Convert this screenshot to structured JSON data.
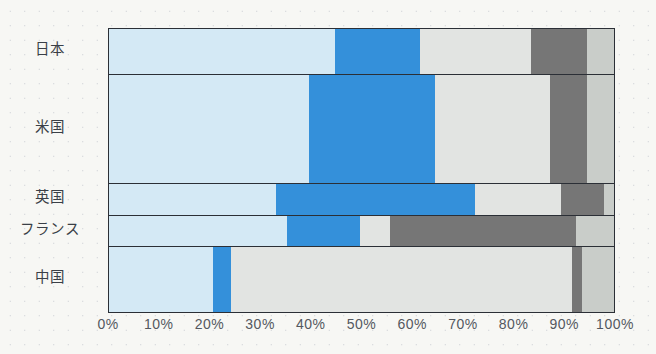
{
  "chart_data": {
    "type": "bar",
    "orientation": "horizontal",
    "stacked": true,
    "normalized": true,
    "title": "",
    "xlabel": "",
    "ylabel": "",
    "xlim": [
      0,
      100
    ],
    "grid": false,
    "legend": "none",
    "categories": [
      "日本",
      "米国",
      "英国",
      "フランス",
      "中国"
    ],
    "tick_labels": [
      "0%",
      "10%",
      "20%",
      "30%",
      "40%",
      "50%",
      "60%",
      "70%",
      "80%",
      "90%",
      "100%"
    ],
    "tick_values": [
      0,
      10,
      20,
      30,
      40,
      50,
      60,
      70,
      80,
      90,
      100
    ],
    "colors": {
      "series1": "#d4e9f5",
      "series2": "#3490da",
      "series3": "#e2e4e2",
      "series4": "#767676",
      "series5": "#c9cdc9"
    },
    "series": [
      {
        "name": "series1",
        "color": "#d4e9f5",
        "values": [
          44.8,
          39.6,
          33.1,
          35.3,
          20.5
        ]
      },
      {
        "name": "series2",
        "color": "#3490da",
        "values": [
          16.8,
          25.0,
          39.3,
          14.4,
          3.6
        ]
      },
      {
        "name": "series3",
        "color": "#e2e4e2",
        "values": [
          22.0,
          22.8,
          17.2,
          5.9,
          67.6
        ]
      },
      {
        "name": "series4",
        "color": "#767676",
        "values": [
          11.1,
          7.3,
          8.5,
          36.9,
          2.0
        ]
      },
      {
        "name": "series5",
        "color": "#c9cdc9",
        "values": [
          5.3,
          5.3,
          1.9,
          7.5,
          6.3
        ]
      }
    ],
    "row_heights_px": [
      46,
      110,
      32,
      32,
      65
    ],
    "rows": [
      {
        "category": "日本",
        "segments": [
          {
            "series": "series1",
            "value": 44.8,
            "color": "#d4e9f5"
          },
          {
            "series": "series2",
            "value": 16.8,
            "color": "#3490da"
          },
          {
            "series": "series3",
            "value": 22.0,
            "color": "#e2e4e2"
          },
          {
            "series": "series4",
            "value": 11.1,
            "color": "#767676"
          },
          {
            "series": "series5",
            "value": 5.3,
            "color": "#c9cdc9"
          }
        ]
      },
      {
        "category": "米国",
        "segments": [
          {
            "series": "series1",
            "value": 39.6,
            "color": "#d4e9f5"
          },
          {
            "series": "series2",
            "value": 25.0,
            "color": "#3490da"
          },
          {
            "series": "series3",
            "value": 22.8,
            "color": "#e2e4e2"
          },
          {
            "series": "series4",
            "value": 7.3,
            "color": "#767676"
          },
          {
            "series": "series5",
            "value": 5.3,
            "color": "#c9cdc9"
          }
        ]
      },
      {
        "category": "英国",
        "segments": [
          {
            "series": "series1",
            "value": 33.1,
            "color": "#d4e9f5"
          },
          {
            "series": "series2",
            "value": 39.3,
            "color": "#3490da"
          },
          {
            "series": "series3",
            "value": 17.2,
            "color": "#e2e4e2"
          },
          {
            "series": "series4",
            "value": 8.5,
            "color": "#767676"
          },
          {
            "series": "series5",
            "value": 1.9,
            "color": "#c9cdc9"
          }
        ]
      },
      {
        "category": "フランス",
        "segments": [
          {
            "series": "series1",
            "value": 35.3,
            "color": "#d4e9f5"
          },
          {
            "series": "series2",
            "value": 14.4,
            "color": "#3490da"
          },
          {
            "series": "series3",
            "value": 5.9,
            "color": "#e2e4e2"
          },
          {
            "series": "series4",
            "value": 36.9,
            "color": "#767676"
          },
          {
            "series": "series5",
            "value": 7.5,
            "color": "#c9cdc9"
          }
        ]
      },
      {
        "category": "中国",
        "segments": [
          {
            "series": "series1",
            "value": 20.5,
            "color": "#d4e9f5"
          },
          {
            "series": "series2",
            "value": 3.6,
            "color": "#3490da"
          },
          {
            "series": "series3",
            "value": 67.6,
            "color": "#e2e4e2"
          },
          {
            "series": "series4",
            "value": 2.0,
            "color": "#767676"
          },
          {
            "series": "series5",
            "value": 6.3,
            "color": "#c9cdc9"
          }
        ]
      }
    ]
  }
}
